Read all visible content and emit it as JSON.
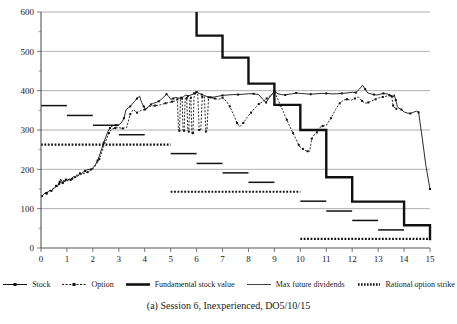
{
  "caption": "(a) Session 6, Inexperienced, DO5/10/15",
  "legend": {
    "items": [
      {
        "label": "Stock",
        "style": "solid-with-markers",
        "icon": "line-marker-icon"
      },
      {
        "label": "Option",
        "style": "dashed-with-markers",
        "icon": "dashed-line-marker-icon"
      },
      {
        "label": "Fundamental stock value",
        "style": "thick-solid",
        "icon": "thick-line-icon"
      },
      {
        "label": "Max future dividends",
        "style": "thin-solid",
        "icon": "thin-line-icon"
      },
      {
        "label": "Rational option strike",
        "style": "dotted-thick",
        "icon": "dotted-line-icon"
      }
    ]
  },
  "chart_data": {
    "type": "line",
    "title": "",
    "xlabel": "",
    "ylabel": "",
    "xlim": [
      0,
      15
    ],
    "ylim": [
      0,
      600
    ],
    "xticks": [
      0,
      1,
      2,
      3,
      4,
      5,
      6,
      7,
      8,
      9,
      10,
      11,
      12,
      13,
      14,
      15
    ],
    "yticks": [
      0,
      100,
      200,
      300,
      400,
      500,
      600
    ],
    "yminorticks": [
      50,
      150,
      250,
      350,
      450,
      550
    ],
    "grid": "horizontal",
    "legend_position": "below-axes",
    "series": [
      {
        "name": "Stock",
        "style": "solid-with-markers",
        "color": "#111111",
        "points": [
          [
            0.04,
            132
          ],
          [
            0.1,
            136
          ],
          [
            0.16,
            140
          ],
          [
            0.22,
            138
          ],
          [
            0.28,
            143
          ],
          [
            0.34,
            147
          ],
          [
            0.4,
            145
          ],
          [
            0.46,
            150
          ],
          [
            0.52,
            152
          ],
          [
            0.58,
            158
          ],
          [
            0.62,
            155
          ],
          [
            0.68,
            163
          ],
          [
            0.72,
            168
          ],
          [
            0.76,
            175
          ],
          [
            0.8,
            170
          ],
          [
            0.84,
            165
          ],
          [
            0.88,
            172
          ],
          [
            0.92,
            168
          ],
          [
            0.96,
            174
          ],
          [
            1.02,
            170
          ],
          [
            1.08,
            176
          ],
          [
            1.14,
            173
          ],
          [
            1.2,
            178
          ],
          [
            1.26,
            182
          ],
          [
            1.32,
            180
          ],
          [
            1.38,
            186
          ],
          [
            1.44,
            184
          ],
          [
            1.5,
            190
          ],
          [
            1.56,
            188
          ],
          [
            1.62,
            193
          ],
          [
            1.7,
            196
          ],
          [
            1.78,
            199
          ],
          [
            1.86,
            200
          ],
          [
            1.94,
            200
          ],
          [
            2.02,
            205
          ],
          [
            2.1,
            212
          ],
          [
            2.18,
            222
          ],
          [
            2.26,
            236
          ],
          [
            2.34,
            252
          ],
          [
            2.42,
            268
          ],
          [
            2.5,
            282
          ],
          [
            2.58,
            296
          ],
          [
            2.66,
            305
          ],
          [
            2.74,
            310
          ],
          [
            2.82,
            312
          ],
          [
            2.9,
            312
          ],
          [
            3.0,
            313
          ],
          [
            3.1,
            318
          ],
          [
            3.2,
            330
          ],
          [
            3.28,
            352
          ],
          [
            3.36,
            356
          ],
          [
            3.44,
            360
          ],
          [
            3.52,
            366
          ],
          [
            3.6,
            372
          ],
          [
            3.7,
            380
          ],
          [
            3.8,
            386
          ],
          [
            3.88,
            370
          ],
          [
            3.96,
            360
          ],
          [
            4.04,
            352
          ],
          [
            4.14,
            360
          ],
          [
            4.24,
            365
          ],
          [
            4.34,
            368
          ],
          [
            4.44,
            370
          ],
          [
            4.54,
            373
          ],
          [
            4.64,
            378
          ],
          [
            4.74,
            384
          ],
          [
            4.84,
            391
          ],
          [
            4.92,
            386
          ],
          [
            5.0,
            378
          ],
          [
            5.1,
            380
          ],
          [
            5.2,
            383
          ],
          [
            5.3,
            381
          ],
          [
            5.4,
            382
          ],
          [
            5.5,
            385
          ],
          [
            5.58,
            389
          ],
          [
            5.66,
            386
          ],
          [
            5.74,
            388
          ],
          [
            5.82,
            390
          ],
          [
            5.9,
            393
          ],
          [
            6.0,
            396
          ],
          [
            6.1,
            393
          ],
          [
            6.2,
            390
          ],
          [
            6.3,
            388
          ],
          [
            6.4,
            385
          ],
          [
            6.55,
            383
          ],
          [
            6.7,
            384
          ],
          [
            6.85,
            386
          ],
          [
            7.0,
            388
          ],
          [
            7.2,
            389
          ],
          [
            7.4,
            390
          ],
          [
            7.6,
            390
          ],
          [
            7.8,
            391
          ],
          [
            8.0,
            392
          ],
          [
            8.2,
            392
          ],
          [
            8.4,
            390
          ],
          [
            8.55,
            378
          ],
          [
            8.68,
            370
          ],
          [
            8.8,
            382
          ],
          [
            8.92,
            392
          ],
          [
            9.0,
            398
          ],
          [
            9.14,
            392
          ],
          [
            9.28,
            390
          ],
          [
            9.42,
            389
          ],
          [
            9.56,
            391
          ],
          [
            9.7,
            392
          ],
          [
            9.84,
            394
          ],
          [
            10.0,
            393
          ],
          [
            10.2,
            392
          ],
          [
            10.4,
            391
          ],
          [
            10.6,
            392
          ],
          [
            10.8,
            393
          ],
          [
            11.0,
            393
          ],
          [
            11.2,
            392
          ],
          [
            11.4,
            392
          ],
          [
            11.6,
            393
          ],
          [
            11.8,
            394
          ],
          [
            12.0,
            396
          ],
          [
            12.14,
            395
          ],
          [
            12.28,
            404
          ],
          [
            12.4,
            414
          ],
          [
            12.5,
            404
          ],
          [
            12.6,
            394
          ],
          [
            12.72,
            392
          ],
          [
            12.84,
            390
          ],
          [
            12.96,
            389
          ],
          [
            13.08,
            391
          ],
          [
            13.2,
            393
          ],
          [
            13.32,
            392
          ],
          [
            13.44,
            390
          ],
          [
            13.52,
            386
          ],
          [
            13.58,
            383
          ],
          [
            13.62,
            390
          ],
          [
            13.68,
            376
          ],
          [
            13.74,
            360
          ],
          [
            13.8,
            355
          ],
          [
            13.9,
            352
          ],
          [
            14.0,
            346
          ],
          [
            14.12,
            343
          ],
          [
            14.24,
            342
          ],
          [
            14.36,
            345
          ],
          [
            14.48,
            348
          ],
          [
            14.56,
            345
          ],
          [
            14.7,
            280
          ],
          [
            14.84,
            210
          ],
          [
            15.0,
            150
          ]
        ]
      },
      {
        "name": "Option",
        "style": "dashed-with-markers",
        "color": "#111111",
        "points": [
          [
            0.2,
            140
          ],
          [
            0.45,
            150
          ],
          [
            0.7,
            163
          ],
          [
            0.95,
            172
          ],
          [
            1.2,
            176
          ],
          [
            1.5,
            186
          ],
          [
            1.8,
            193
          ],
          [
            2.05,
            204
          ],
          [
            2.25,
            226
          ],
          [
            2.45,
            264
          ],
          [
            2.62,
            292
          ],
          [
            2.72,
            302
          ],
          [
            2.86,
            305
          ],
          [
            3.0,
            306
          ],
          [
            3.15,
            304
          ],
          [
            3.3,
            306
          ],
          [
            3.44,
            340
          ],
          [
            3.56,
            352
          ],
          [
            3.7,
            344
          ],
          [
            3.86,
            350
          ],
          [
            4.0,
            352
          ],
          [
            4.2,
            360
          ],
          [
            4.4,
            362
          ],
          [
            4.6,
            364
          ],
          [
            4.8,
            368
          ],
          [
            4.95,
            370
          ],
          [
            5.05,
            372
          ],
          [
            5.18,
            374
          ],
          [
            5.26,
            378
          ],
          [
            5.3,
            300
          ],
          [
            5.34,
            298
          ],
          [
            5.38,
            380
          ],
          [
            5.44,
            380
          ],
          [
            5.48,
            296
          ],
          [
            5.52,
            298
          ],
          [
            5.56,
            380
          ],
          [
            5.62,
            381
          ],
          [
            5.66,
            298
          ],
          [
            5.7,
            296
          ],
          [
            5.74,
            380
          ],
          [
            5.78,
            382
          ],
          [
            5.82,
            290
          ],
          [
            5.86,
            292
          ],
          [
            5.9,
            383
          ],
          [
            5.98,
            396
          ],
          [
            6.04,
            398
          ],
          [
            6.1,
            300
          ],
          [
            6.16,
            298
          ],
          [
            6.22,
            384
          ],
          [
            6.3,
            385
          ],
          [
            6.36,
            296
          ],
          [
            6.4,
            298
          ],
          [
            6.46,
            383
          ],
          [
            6.56,
            382
          ],
          [
            6.7,
            380
          ],
          [
            6.86,
            378
          ],
          [
            7.0,
            382
          ],
          [
            7.14,
            374
          ],
          [
            7.28,
            360
          ],
          [
            7.42,
            340
          ],
          [
            7.56,
            318
          ],
          [
            7.66,
            308
          ],
          [
            7.8,
            318
          ],
          [
            7.95,
            332
          ],
          [
            8.1,
            344
          ],
          [
            8.25,
            356
          ],
          [
            8.4,
            366
          ],
          [
            8.55,
            372
          ],
          [
            8.7,
            380
          ],
          [
            8.85,
            388
          ],
          [
            9.0,
            396
          ],
          [
            9.12,
            380
          ],
          [
            9.24,
            362
          ],
          [
            9.36,
            344
          ],
          [
            9.48,
            326
          ],
          [
            9.6,
            308
          ],
          [
            9.72,
            292
          ],
          [
            9.84,
            276
          ],
          [
            9.94,
            262
          ],
          [
            10.0,
            256
          ],
          [
            10.1,
            252
          ],
          [
            10.2,
            248
          ],
          [
            10.28,
            246
          ],
          [
            10.36,
            246
          ],
          [
            10.44,
            278
          ],
          [
            10.56,
            290
          ],
          [
            10.64,
            294
          ],
          [
            10.74,
            306
          ],
          [
            10.86,
            310
          ],
          [
            11.0,
            312
          ],
          [
            11.18,
            330
          ],
          [
            11.36,
            352
          ],
          [
            11.52,
            368
          ],
          [
            11.66,
            376
          ],
          [
            11.8,
            378
          ],
          [
            11.96,
            376
          ],
          [
            12.1,
            380
          ],
          [
            12.24,
            384
          ],
          [
            12.38,
            374
          ],
          [
            12.5,
            368
          ],
          [
            12.62,
            370
          ],
          [
            12.76,
            374
          ],
          [
            12.9,
            378
          ],
          [
            13.04,
            382
          ],
          [
            13.18,
            384
          ],
          [
            13.32,
            386
          ],
          [
            13.44,
            388
          ],
          [
            13.52,
            386
          ],
          [
            13.58,
            362
          ],
          [
            13.64,
            356
          ],
          [
            13.7,
            354
          ]
        ]
      }
    ],
    "step_series": {
      "name": "Fundamental stock value",
      "style": "thick-solid",
      "color": "#111111",
      "steps": [
        [
          6.0,
          600
        ],
        [
          6.0,
          540
        ],
        [
          7.0,
          540
        ],
        [
          7.0,
          484
        ],
        [
          8.0,
          484
        ],
        [
          8.0,
          418
        ],
        [
          9.0,
          418
        ],
        [
          9.0,
          364
        ],
        [
          10.0,
          364
        ],
        [
          10.0,
          300
        ],
        [
          11.0,
          300
        ],
        [
          11.0,
          180
        ],
        [
          12.0,
          180
        ],
        [
          12.0,
          118
        ],
        [
          14.0,
          118
        ],
        [
          14.0,
          58
        ],
        [
          15.0,
          58
        ],
        [
          15.0,
          20
        ]
      ]
    },
    "segment_series": {
      "name": "Max future dividends",
      "style": "thin-solid",
      "color": "#111111",
      "segments": [
        {
          "x0": 0.0,
          "x1": 1.0,
          "y": 362
        },
        {
          "x0": 1.0,
          "x1": 2.0,
          "y": 337
        },
        {
          "x0": 2.0,
          "x1": 3.0,
          "y": 312
        },
        {
          "x0": 3.0,
          "x1": 4.0,
          "y": 288
        },
        {
          "x0": 5.0,
          "x1": 6.0,
          "y": 240
        },
        {
          "x0": 6.0,
          "x1": 7.0,
          "y": 215
        },
        {
          "x0": 7.0,
          "x1": 8.0,
          "y": 191
        },
        {
          "x0": 8.0,
          "x1": 9.0,
          "y": 167
        },
        {
          "x0": 10.0,
          "x1": 11.0,
          "y": 119
        },
        {
          "x0": 11.0,
          "x1": 12.0,
          "y": 94
        },
        {
          "x0": 12.0,
          "x1": 13.0,
          "y": 70
        },
        {
          "x0": 13.0,
          "x1": 14.0,
          "y": 46
        }
      ]
    },
    "strike_series": {
      "name": "Rational option strike",
      "style": "dotted-thick",
      "color": "#111111",
      "segments": [
        {
          "x0": 0.0,
          "x1": 5.0,
          "y": 263
        },
        {
          "x0": 5.0,
          "x1": 10.0,
          "y": 143
        },
        {
          "x0": 10.0,
          "x1": 15.0,
          "y": 23
        }
      ]
    }
  }
}
